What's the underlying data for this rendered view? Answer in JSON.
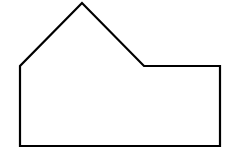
{
  "figure": {
    "kind": "geometric-shape",
    "shape_name": "hexagon",
    "background_color": "#ffffff",
    "stroke_color": "#000000",
    "fill_color": "#ffffff",
    "stroke_width": 2.2,
    "canvas": {
      "width": 233,
      "height": 159
    },
    "vertices": [
      {
        "name": "apex",
        "x": 82,
        "y": 3
      },
      {
        "name": "left-shoulder",
        "x": 20,
        "y": 66
      },
      {
        "name": "bottom-left",
        "x": 20,
        "y": 146
      },
      {
        "name": "bottom-right",
        "x": 220,
        "y": 146
      },
      {
        "name": "top-right",
        "x": 220,
        "y": 66
      },
      {
        "name": "notch",
        "x": 144,
        "y": 66
      }
    ],
    "edges": [
      {
        "name": "left-roof-slope",
        "from": "apex",
        "to": "left-shoulder"
      },
      {
        "name": "left-wall",
        "from": "left-shoulder",
        "to": "bottom-left"
      },
      {
        "name": "base",
        "from": "bottom-left",
        "to": "bottom-right"
      },
      {
        "name": "right-wall",
        "from": "bottom-right",
        "to": "top-right"
      },
      {
        "name": "step-top",
        "from": "top-right",
        "to": "notch"
      },
      {
        "name": "right-roof-slope",
        "from": "notch",
        "to": "apex"
      }
    ],
    "points_string": "82,3 20,66 20,146 220,146 220,66 144,66"
  }
}
